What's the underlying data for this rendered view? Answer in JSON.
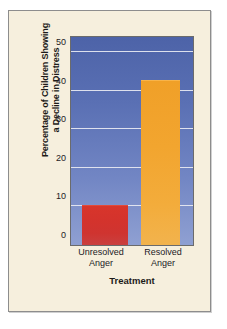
{
  "card": {
    "background_color": "#f6efdd",
    "border_color": "#8d8d8d"
  },
  "chart_data": {
    "type": "bar",
    "title": "",
    "subtitle": "",
    "xlabel": "Treatment",
    "ylabel": "Percentage of Children Showing a Decline in Distress",
    "ylabel_line1": "Percentage of Children Showing",
    "ylabel_line2": "a Decline in Distress",
    "categories": [
      "Unresolved Anger",
      "Resolved Anger"
    ],
    "category_lines": [
      {
        "line1": "Unresolved",
        "line2": "Anger"
      },
      {
        "line1": "Resolved",
        "line2": "Anger"
      }
    ],
    "values": [
      10,
      42.5
    ],
    "bar_colors": [
      "#d4332c",
      "#f0a028"
    ],
    "ylim": [
      0,
      54
    ],
    "yticks": [
      0,
      10,
      20,
      30,
      40,
      50
    ],
    "ytick_labels": [
      "0",
      "10",
      "20",
      "30",
      "40",
      "50"
    ],
    "grid": true,
    "gridline_color": "#e8eaf2",
    "legend": "none",
    "plot_background": "#5a70b4"
  }
}
